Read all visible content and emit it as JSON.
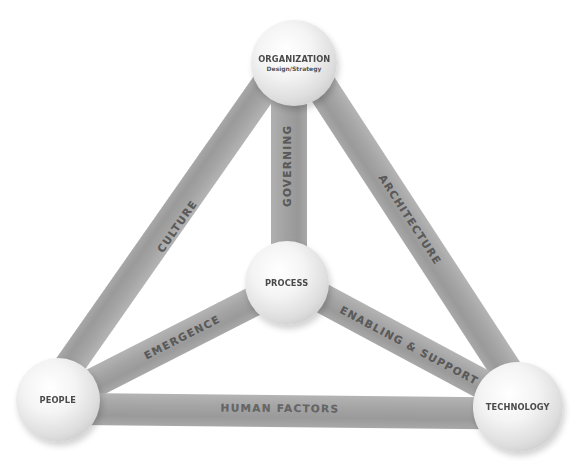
{
  "diagram": {
    "type": "tetrahedron-network",
    "colors": {
      "background": "#ffffff",
      "bar": "#a6a6a6",
      "sphere_light": "#f4f4f4",
      "sphere_shadow": "#bdbdbd",
      "text": "#555555"
    },
    "nodes": {
      "organization": {
        "label": "ORGANIZATION",
        "sublabel": "Design/Strategy"
      },
      "process": {
        "label": "PROCESS"
      },
      "people": {
        "label": "PEOPLE"
      },
      "technology": {
        "label": "TECHNOLOGY"
      }
    },
    "edges": {
      "culture": {
        "label": "CULTURE",
        "from": "organization",
        "to": "people"
      },
      "governing": {
        "label": "GOVERNING",
        "from": "organization",
        "to": "process"
      },
      "architecture": {
        "label": "ARCHITECTURE",
        "from": "organization",
        "to": "technology"
      },
      "emergence": {
        "label": "EMERGENCE",
        "from": "people",
        "to": "process"
      },
      "enabling_support": {
        "label": "ENABLING & SUPPORT",
        "from": "process",
        "to": "technology"
      },
      "human_factors": {
        "label": "HUMAN FACTORS",
        "from": "people",
        "to": "technology"
      }
    }
  }
}
